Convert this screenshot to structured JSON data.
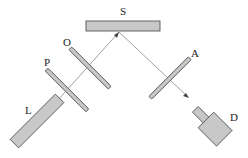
{
  "diagram": {
    "labels": {
      "S": "S",
      "O": "O",
      "P": "P",
      "L": "L",
      "A": "A",
      "D": "D"
    },
    "colors": {
      "fill": "#c8c8c8",
      "stroke": "#555555",
      "beam": "#777777",
      "text": "#222222"
    },
    "components": [
      {
        "id": "L",
        "description": "light source (laser)"
      },
      {
        "id": "P",
        "description": "plate / polarizer"
      },
      {
        "id": "O",
        "description": "plate / optical element"
      },
      {
        "id": "S",
        "description": "sample surface"
      },
      {
        "id": "A",
        "description": "analyzer plate"
      },
      {
        "id": "D",
        "description": "detector"
      }
    ]
  }
}
